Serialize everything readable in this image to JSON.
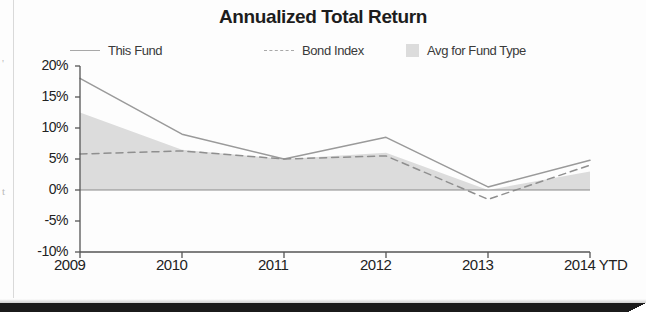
{
  "chart_data": {
    "type": "line",
    "title": "Annualized Total Return",
    "xlabel": "",
    "ylabel": "",
    "grid": false,
    "legend_position": "top",
    "categories": [
      "2009",
      "2010",
      "2011",
      "2012",
      "2013",
      "2014 YTD"
    ],
    "ylim": [
      -10,
      20
    ],
    "ytick_labels": [
      "20%",
      "15%",
      "10%",
      "5%",
      "0%",
      "-5%",
      "-10%"
    ],
    "ytick_values": [
      20,
      15,
      10,
      5,
      0,
      -5,
      -10
    ],
    "series": [
      {
        "name": "This Fund",
        "style": "solid-line",
        "color": "#9a9a9a",
        "values": [
          18.0,
          9.0,
          5.0,
          8.5,
          0.5,
          4.8
        ]
      },
      {
        "name": "Bond Index",
        "style": "dashed-line",
        "color": "#8f8f8f",
        "values": [
          5.8,
          6.3,
          5.0,
          5.5,
          -1.5,
          4.0
        ]
      },
      {
        "name": "Avg for Fund Type",
        "style": "filled-area",
        "color": "#dcdcdc",
        "values": [
          12.5,
          6.5,
          5.0,
          6.0,
          0.0,
          3.0
        ]
      }
    ]
  },
  "figure": {
    "title": "Annualized Total Return",
    "legend": [
      {
        "label": "This Fund",
        "swatch": "solid-line-swatch"
      },
      {
        "label": "Bond Index",
        "swatch": "dashed-line-swatch"
      },
      {
        "label": "Avg for Fund Type",
        "swatch": "gray-box-swatch"
      }
    ],
    "y_axis": {
      "labels": [
        "20%",
        "15%",
        "10%",
        "5%",
        "0%",
        "-5%",
        "-10%"
      ]
    },
    "x_axis": {
      "labels": [
        "2009",
        "2010",
        "2011",
        "2012",
        "2013",
        "2014 YTD"
      ]
    },
    "margin_artifacts": [
      "'",
      "t"
    ]
  }
}
